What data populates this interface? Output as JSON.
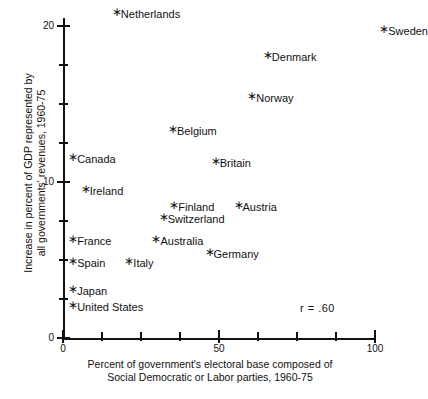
{
  "chart_data": {
    "type": "scatter",
    "title": "",
    "xlabel": "Percent of government's electoral base composed of Social Democratic or Labor parties, 1960-75",
    "xlabel_line1": "Percent of government's electoral base composed of",
    "xlabel_line2": "Social Democratic or Labor parties, 1960-75",
    "ylabel": "Increase in percent of GDP represented by all governments' revenues, 1960-75",
    "ylabel_line1": "Increase in percent of GDP represented by",
    "ylabel_line2": "all governments' revenues, 1960-75",
    "xlim": [
      0,
      104
    ],
    "ylim": [
      0,
      20.8
    ],
    "xticks": [
      0,
      12.5,
      25,
      37.5,
      50,
      62.5,
      75,
      87.5,
      100
    ],
    "xtick_labels": [
      "0",
      "",
      "",
      "",
      "50",
      "",
      "",
      "",
      "100"
    ],
    "yticks": [
      0,
      2.5,
      5,
      7.5,
      10,
      12.5,
      15,
      17.5,
      20
    ],
    "ytick_labels": [
      "0",
      "",
      "",
      "",
      "10",
      "",
      "",
      "",
      "20"
    ],
    "grid": false,
    "legend": false,
    "annotation": "r = .60",
    "points": [
      {
        "label": "Netherlands",
        "x": 16.3,
        "y": 20.8
      },
      {
        "label": "Sweden",
        "x": 102.0,
        "y": 19.7
      },
      {
        "label": "Denmark",
        "x": 64.7,
        "y": 18.0
      },
      {
        "label": "Norway",
        "x": 59.7,
        "y": 15.4
      },
      {
        "label": "Belgium",
        "x": 34.3,
        "y": 13.3
      },
      {
        "label": "Canada",
        "x": 2.3,
        "y": 11.5
      },
      {
        "label": "Britain",
        "x": 48.0,
        "y": 11.2
      },
      {
        "label": "Ireland",
        "x": 6.3,
        "y": 9.4
      },
      {
        "label": "Finland",
        "x": 34.7,
        "y": 8.4
      },
      {
        "label": "Austria",
        "x": 55.3,
        "y": 8.4
      },
      {
        "label": "Switzerland",
        "x": 31.3,
        "y": 7.6
      },
      {
        "label": "France",
        "x": 2.3,
        "y": 6.2
      },
      {
        "label": "Australia",
        "x": 29.0,
        "y": 6.2
      },
      {
        "label": "Germany",
        "x": 46.0,
        "y": 5.4
      },
      {
        "label": "Spain",
        "x": 2.3,
        "y": 4.8
      },
      {
        "label": "Italy",
        "x": 20.3,
        "y": 4.8
      },
      {
        "label": "Japan",
        "x": 2.3,
        "y": 3.0
      },
      {
        "label": "United States",
        "x": 2.3,
        "y": 2.0
      }
    ]
  }
}
